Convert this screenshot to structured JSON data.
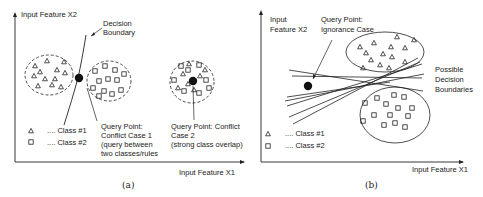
{
  "panel_a": {
    "y_axis_label": "Input Feature X2",
    "x_axis_label": "Input Feature X1",
    "decision_boundary_label_1": "Decision",
    "decision_boundary_label_2": "Boundary",
    "query1_line1": "Query Point:",
    "query1_line2": "Conflict Case 1",
    "query1_line3": "(query between",
    "query1_line4": "two classes/rules",
    "query2_line1": "Query Point: Conflict",
    "query2_line2": "Case 2",
    "query2_line3": "(strong class overlap)",
    "legend": [
      {
        "symbol": "triangle-icon",
        "label": ".... Class #1"
      },
      {
        "symbol": "square-icon",
        "label": ".... Class #2"
      }
    ],
    "caption": "(a)"
  },
  "panel_b": {
    "y_axis_label_1": "Input",
    "y_axis_label_2": "Feature X2",
    "x_axis_label": "Input Feature X1",
    "query_line1": "Query Point:",
    "query_line2": "Ignorance Case",
    "boundaries_line1": "Possible",
    "boundaries_line2": "Decision",
    "boundaries_line3": "Boundaries",
    "legend": [
      {
        "symbol": "triangle-icon",
        "label": ".... Class #1"
      },
      {
        "symbol": "square-icon",
        "label": ".... Class #2"
      }
    ],
    "caption": "(b)"
  }
}
